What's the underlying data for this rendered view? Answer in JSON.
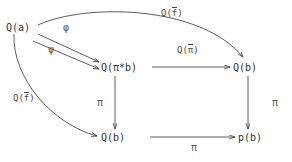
{
  "diagram": {
    "type": "commutative-diagram",
    "stroke_color": "#4a4a4a",
    "text_color": "#2f2f2f",
    "background": "#ffffff",
    "nodes": [
      {
        "id": "qa",
        "label": "Q(a)",
        "position": "top-left"
      },
      {
        "id": "qpib",
        "label": "Q(π*b)",
        "position": "center"
      },
      {
        "id": "qb_right",
        "label": "Q(b)",
        "position": "middle-right"
      },
      {
        "id": "qb_bot",
        "label": "Q(b)",
        "position": "bottom-center"
      },
      {
        "id": "pb",
        "label": "p(b)",
        "position": "bottom-right"
      }
    ],
    "edges": [
      {
        "id": "phi",
        "label": "φ",
        "from": "qa",
        "to": "qpib",
        "style": "straight"
      },
      {
        "id": "psi",
        "label": "ψ",
        "from": "qa",
        "to": "qpib",
        "style": "straight"
      },
      {
        "id": "qfbar_top",
        "label_prefix": "Q(",
        "label_bar": "f",
        "label_suffix": ")",
        "from": "qa",
        "to": "qb_right",
        "style": "curved-arc-top"
      },
      {
        "id": "qfbar_left",
        "label_prefix": "Q(",
        "label_bar": "f",
        "label_suffix": ")",
        "from": "qa",
        "to": "qb_bot",
        "style": "curved-arc-left"
      },
      {
        "id": "qpibar",
        "label_prefix": "Q(",
        "label_bar": "π",
        "label_suffix": ")",
        "from": "qpib",
        "to": "qb_right",
        "style": "straight-horizontal"
      },
      {
        "id": "pi_mid",
        "label": "π",
        "from": "qpib",
        "to": "qb_bot",
        "style": "straight-vertical"
      },
      {
        "id": "pi_right",
        "label": "π",
        "from": "qb_right",
        "to": "pb",
        "style": "straight-vertical"
      },
      {
        "id": "pi_bot",
        "label": "π",
        "from": "qb_bot",
        "to": "pb",
        "style": "straight-horizontal"
      }
    ]
  }
}
